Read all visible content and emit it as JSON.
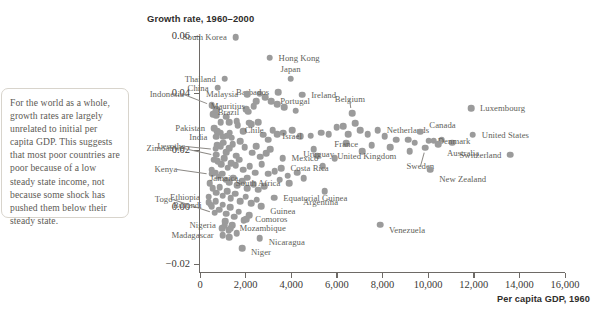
{
  "caption": {
    "text": "For the world as a whole, growth rates are largely unrelated to initial per capita GDP. This suggests that most poor countries are poor because of a low steady state income, not because some shock has pushed them below their steady state."
  },
  "chart_data": {
    "type": "scatter",
    "title": "Growth rate, 1960–2000",
    "xlabel": "Per capita GDP, 1960",
    "ylabel": "Growth rate, 1960–2000",
    "xlim": [
      -1000,
      16600
    ],
    "ylim": [
      -0.02,
      0.06
    ],
    "xticks": [
      0,
      2000,
      4000,
      6000,
      8000,
      10000,
      12000,
      14000,
      16000
    ],
    "xticklabels": [
      "0",
      "2,000",
      "4,000",
      "6,000",
      "8,000",
      "10,000",
      "12,000",
      "14,000",
      "16,000"
    ],
    "yticks": [
      -0.02,
      0.0,
      0.02,
      0.04,
      0.06
    ],
    "yticklabels": [
      "−0.02",
      "0.00",
      "0.02",
      "0.04",
      "0.06"
    ],
    "grid": false,
    "legend": null,
    "marker_color": "#9b9b9b",
    "label_color": "#625f5a",
    "points": [
      {
        "name": "South Korea",
        "x": 1570,
        "y": 0.0598,
        "lx": -9,
        "ly": 0,
        "anchor": "r"
      },
      {
        "name": "Hong Kong",
        "x": 3050,
        "y": 0.0525,
        "lx": 9,
        "ly": 0,
        "anchor": "l"
      },
      {
        "name": "Thailand",
        "x": 1090,
        "y": 0.0452,
        "lx": -9,
        "ly": 0,
        "anchor": "r"
      },
      {
        "name": "China",
        "x": 770,
        "y": 0.0421,
        "lx": -9,
        "ly": 0,
        "anchor": "r"
      },
      {
        "name": "Japan",
        "x": 3970,
        "y": 0.0452,
        "lx": 0,
        "ly": -10,
        "anchor": "c"
      },
      {
        "name": "Barbados",
        "x": 3430,
        "y": 0.0405,
        "lx": -9,
        "ly": 0,
        "anchor": "r"
      },
      {
        "name": "Malaysia",
        "x": 2070,
        "y": 0.0398,
        "lx": -9,
        "ly": 0,
        "anchor": "r"
      },
      {
        "name": "Ireland",
        "x": 4480,
        "y": 0.0396,
        "lx": 9,
        "ly": 0,
        "anchor": "l"
      },
      {
        "name": "Indonesia",
        "x": 520,
        "y": 0.0358,
        "lx": -28,
        "ly": -11,
        "anchor": "r",
        "leader": true
      },
      {
        "name": "Portugal",
        "x": 3120,
        "y": 0.0372,
        "lx": 9,
        "ly": 0,
        "anchor": "l"
      },
      {
        "name": "Mauritius",
        "x": 2360,
        "y": 0.0355,
        "lx": -9,
        "ly": 0,
        "anchor": "r"
      },
      {
        "name": "Brazil",
        "x": 2110,
        "y": 0.0336,
        "lx": -9,
        "ly": 0,
        "anchor": "r"
      },
      {
        "name": "Belgium",
        "x": 6660,
        "y": 0.033,
        "lx": -2,
        "ly": -14,
        "anchor": "c",
        "leader": true
      },
      {
        "name": "Luxembourg",
        "x": 11880,
        "y": 0.0348,
        "lx": 9,
        "ly": 0,
        "anchor": "l"
      },
      {
        "name": "Pakistan",
        "x": 620,
        "y": 0.0278,
        "lx": -9,
        "ly": 0,
        "anchor": "r"
      },
      {
        "name": "Chile",
        "x": 3190,
        "y": 0.0272,
        "lx": -9,
        "ly": 0,
        "anchor": "r"
      },
      {
        "name": "Netherlands",
        "x": 7790,
        "y": 0.0272,
        "lx": 9,
        "ly": 0,
        "anchor": "l"
      },
      {
        "name": "Canada",
        "x": 9660,
        "y": 0.0266,
        "lx": 9,
        "ly": -7,
        "anchor": "l"
      },
      {
        "name": "United States",
        "x": 11960,
        "y": 0.0256,
        "lx": 9,
        "ly": 0,
        "anchor": "l"
      },
      {
        "name": "India",
        "x": 720,
        "y": 0.0248,
        "lx": -9,
        "ly": 0,
        "anchor": "r"
      },
      {
        "name": "France",
        "x": 6500,
        "y": 0.0258,
        "lx": -2,
        "ly": 10,
        "anchor": "c"
      },
      {
        "name": "Israel",
        "x": 4860,
        "y": 0.0252,
        "lx": -9,
        "ly": 0,
        "anchor": "r"
      },
      {
        "name": "Denmark",
        "x": 10030,
        "y": 0.0234,
        "lx": 9,
        "ly": 0,
        "anchor": "l"
      },
      {
        "name": "Lesotho",
        "x": 680,
        "y": 0.0207,
        "lx": -30,
        "ly": -3,
        "anchor": "r",
        "leader": true
      },
      {
        "name": "United Kingdom",
        "x": 7530,
        "y": 0.0219,
        "lx": -5,
        "ly": 11,
        "anchor": "c"
      },
      {
        "name": "Australia",
        "x": 10430,
        "y": 0.0222,
        "lx": 9,
        "ly": 9,
        "anchor": "l"
      },
      {
        "name": "Zimbabwe",
        "x": 700,
        "y": 0.0185,
        "lx": -32,
        "ly": -7,
        "anchor": "r",
        "leader": true
      },
      {
        "name": "Sweden",
        "x": 9880,
        "y": 0.021,
        "lx": -5,
        "ly": 18,
        "anchor": "c",
        "leader": true
      },
      {
        "name": "Switzerland",
        "x": 13610,
        "y": 0.0185,
        "lx": -9,
        "ly": 0,
        "anchor": "r"
      },
      {
        "name": "Mexico",
        "x": 3620,
        "y": 0.0172,
        "lx": 9,
        "ly": 0,
        "anchor": "l"
      },
      {
        "name": "Uruguay",
        "x": 5380,
        "y": 0.0145,
        "lx": -4,
        "ly": -12,
        "anchor": "c"
      },
      {
        "name": "Costa Rica",
        "x": 3570,
        "y": 0.0138,
        "lx": 9,
        "ly": 0,
        "anchor": "l"
      },
      {
        "name": "New Zealand",
        "x": 10090,
        "y": 0.0132,
        "lx": 9,
        "ly": 9,
        "anchor": "l"
      },
      {
        "name": "Kenya",
        "x": 540,
        "y": 0.0118,
        "lx": -35,
        "ly": -5,
        "anchor": "r",
        "leader": true
      },
      {
        "name": "Jamaica",
        "x": 2070,
        "y": 0.0105,
        "lx": -9,
        "ly": 0,
        "anchor": "r"
      },
      {
        "name": "South Africa",
        "x": 3920,
        "y": 0.0085,
        "lx": -9,
        "ly": 0,
        "anchor": "r"
      },
      {
        "name": "Argentina",
        "x": 5460,
        "y": 0.0058,
        "lx": -4,
        "ly": 11,
        "anchor": "c"
      },
      {
        "name": "Ethiopia",
        "x": 390,
        "y": 0.0038,
        "lx": -9,
        "ly": 0,
        "anchor": "r"
      },
      {
        "name": "Equatorial Guinea",
        "x": 3250,
        "y": 0.0035,
        "lx": 9,
        "ly": 0,
        "anchor": "l"
      },
      {
        "name": "Burundi",
        "x": 470,
        "y": 0.001,
        "lx": -9,
        "ly": 0,
        "anchor": "r"
      },
      {
        "name": "Guinea",
        "x": 2680,
        "y": 0.0005,
        "lx": 9,
        "ly": 5,
        "anchor": "l"
      },
      {
        "name": "Togo",
        "x": 640,
        "y": -0.0018,
        "lx": -42,
        "ly": -14,
        "anchor": "r",
        "leader": true
      },
      {
        "name": "Comoros",
        "x": 2030,
        "y": -0.0042,
        "lx": 9,
        "ly": 0,
        "anchor": "l"
      },
      {
        "name": "Nigeria",
        "x": 1090,
        "y": -0.0062,
        "lx": -9,
        "ly": 0,
        "anchor": "r"
      },
      {
        "name": "Mozambique",
        "x": 1340,
        "y": -0.0072,
        "lx": 9,
        "ly": 0,
        "anchor": "l"
      },
      {
        "name": "Venezuela",
        "x": 7890,
        "y": -0.006,
        "lx": 9,
        "ly": 5,
        "anchor": "l"
      },
      {
        "name": "Madagascar",
        "x": 1000,
        "y": -0.0098,
        "lx": -9,
        "ly": 0,
        "anchor": "r"
      },
      {
        "name": "Nicaragua",
        "x": 2620,
        "y": -0.0108,
        "lx": 9,
        "ly": 4,
        "anchor": "l"
      },
      {
        "name": "Niger",
        "x": 1840,
        "y": -0.0142,
        "lx": 9,
        "ly": 4,
        "anchor": "l"
      }
    ],
    "unlabeled_points": [
      [
        560,
        0.0328
      ],
      [
        660,
        0.033
      ],
      [
        700,
        0.0345
      ],
      [
        710,
        0.0322
      ],
      [
        900,
        0.03
      ],
      [
        1140,
        0.0318
      ],
      [
        1290,
        0.03
      ],
      [
        1600,
        0.0302
      ],
      [
        2020,
        0.0345
      ],
      [
        2460,
        0.0372
      ],
      [
        2620,
        0.04
      ],
      [
        2850,
        0.0388
      ],
      [
        3380,
        0.0362
      ],
      [
        3700,
        0.0352
      ],
      [
        4190,
        0.034
      ],
      [
        2150,
        0.0298
      ],
      [
        760,
        0.0268
      ],
      [
        880,
        0.0262
      ],
      [
        1010,
        0.0248
      ],
      [
        1180,
        0.0252
      ],
      [
        1300,
        0.0262
      ],
      [
        1390,
        0.0245
      ],
      [
        1650,
        0.0288
      ],
      [
        1900,
        0.0268
      ],
      [
        2250,
        0.0292
      ],
      [
        2560,
        0.03
      ],
      [
        2780,
        0.0255
      ],
      [
        3000,
        0.0238
      ],
      [
        3380,
        0.0258
      ],
      [
        3660,
        0.0262
      ],
      [
        4050,
        0.0272
      ],
      [
        4380,
        0.025
      ],
      [
        5300,
        0.0262
      ],
      [
        5650,
        0.0258
      ],
      [
        6000,
        0.0282
      ],
      [
        6280,
        0.0285
      ],
      [
        6800,
        0.0295
      ],
      [
        7020,
        0.0272
      ],
      [
        7350,
        0.0258
      ],
      [
        8100,
        0.025
      ],
      [
        8600,
        0.0238
      ],
      [
        9120,
        0.0238
      ],
      [
        9420,
        0.0228
      ],
      [
        10250,
        0.0235
      ],
      [
        10600,
        0.0238
      ],
      [
        11050,
        0.0228
      ],
      [
        760,
        0.0218
      ],
      [
        900,
        0.0215
      ],
      [
        1020,
        0.0228
      ],
      [
        1160,
        0.0195
      ],
      [
        1270,
        0.0208
      ],
      [
        1430,
        0.0222
      ],
      [
        1580,
        0.0182
      ],
      [
        1750,
        0.0232
      ],
      [
        1960,
        0.0212
      ],
      [
        2300,
        0.0192
      ],
      [
        2460,
        0.0215
      ],
      [
        2640,
        0.0178
      ],
      [
        2900,
        0.019
      ],
      [
        3080,
        0.0205
      ],
      [
        620,
        0.0168
      ],
      [
        780,
        0.0162
      ],
      [
        920,
        0.0152
      ],
      [
        1060,
        0.0172
      ],
      [
        1220,
        0.014
      ],
      [
        1380,
        0.0155
      ],
      [
        1560,
        0.0148
      ],
      [
        1720,
        0.0168
      ],
      [
        1900,
        0.0132
      ],
      [
        2180,
        0.0145
      ],
      [
        2420,
        0.0122
      ],
      [
        2700,
        0.0152
      ],
      [
        2980,
        0.0118
      ],
      [
        3280,
        0.0128
      ],
      [
        3500,
        0.0098
      ],
      [
        3850,
        0.0112
      ],
      [
        4250,
        0.0122
      ],
      [
        4550,
        0.0102
      ],
      [
        520,
        0.0132
      ],
      [
        660,
        0.0122
      ],
      [
        820,
        0.0108
      ],
      [
        980,
        0.0118
      ],
      [
        1120,
        0.0098
      ],
      [
        1280,
        0.0088
      ],
      [
        1460,
        0.0105
      ],
      [
        1620,
        0.0078
      ],
      [
        1840,
        0.0092
      ],
      [
        2080,
        0.0068
      ],
      [
        2350,
        0.0082
      ],
      [
        2560,
        0.0062
      ],
      [
        2820,
        0.0075
      ],
      [
        420,
        0.0085
      ],
      [
        560,
        0.0068
      ],
      [
        700,
        0.0052
      ],
      [
        860,
        0.0072
      ],
      [
        1000,
        0.0042
      ],
      [
        1180,
        0.0058
      ],
      [
        1340,
        0.0032
      ],
      [
        1540,
        0.0048
      ],
      [
        1760,
        0.0022
      ],
      [
        2000,
        0.0038
      ],
      [
        2250,
        0.0015
      ],
      [
        2480,
        0.0028
      ],
      [
        380,
        0.0018
      ],
      [
        520,
        0.0005
      ],
      [
        680,
        0.0022
      ],
      [
        840,
        -0.0008
      ],
      [
        1000,
        0.001
      ],
      [
        1160,
        -0.0022
      ],
      [
        1320,
        0.0002
      ],
      [
        1500,
        -0.0032
      ],
      [
        1700,
        -0.0015
      ],
      [
        1920,
        -0.0045
      ],
      [
        2150,
        -0.0028
      ],
      [
        1100,
        -0.0048
      ],
      [
        1250,
        -0.008
      ],
      [
        1420,
        -0.0062
      ],
      [
        1600,
        -0.009
      ],
      [
        1280,
        -0.0105
      ],
      [
        980,
        -0.0072
      ],
      [
        4980,
        0.0205
      ],
      [
        5150,
        0.0182
      ],
      [
        5900,
        0.0172
      ],
      [
        6420,
        0.0225
      ],
      [
        7100,
        0.0198
      ],
      [
        8350,
        0.0212
      ],
      [
        9200,
        0.0198
      ]
    ]
  }
}
